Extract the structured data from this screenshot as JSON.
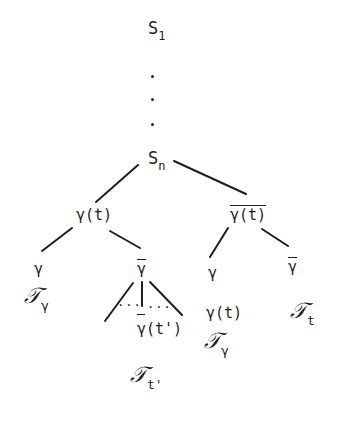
{
  "diagram": {
    "type": "tree",
    "root": {
      "base": "S",
      "sub": "1"
    },
    "ellipsis": [
      "·",
      "·",
      "·"
    ],
    "sn": {
      "base": "S",
      "sub": "n"
    },
    "left_branch": {
      "label": "γ(t)",
      "children": [
        {
          "label": "γ",
          "leaf": {
            "glyph": "𝒯",
            "sub": "γ"
          }
        },
        {
          "label": "γ",
          "overline": true,
          "fan": {
            "left_dots": "...",
            "right_dots": "..."
          },
          "child": {
            "label": "γ(t')",
            "overline_first": true
          },
          "leaf": {
            "glyph": "𝒯",
            "sub": "t'"
          }
        }
      ]
    },
    "right_branch": {
      "label": "γ(t)",
      "overline": true,
      "children": [
        {
          "label": "γ",
          "child_label": "γ(t)",
          "leaf": {
            "glyph": "𝒯",
            "sub": "γ"
          }
        },
        {
          "label": "γ",
          "overline": true,
          "leaf": {
            "glyph": "𝒯",
            "sub": "t"
          }
        }
      ]
    },
    "stroke_color": "#1e1e1e",
    "background": "#ffffff"
  }
}
